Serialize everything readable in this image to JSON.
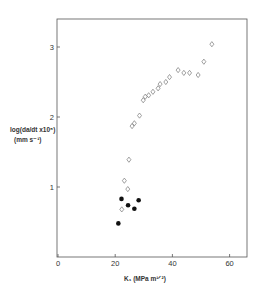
{
  "chart_data": {
    "type": "scatter",
    "title": "",
    "xlabel": "K_I (MPa m^1/2)",
    "ylabel": "log(da/dt x 10^5) (mm s^-1)",
    "xlim": [
      0,
      65
    ],
    "ylim": [
      0,
      3.4
    ],
    "x_ticks": [
      0,
      20,
      40,
      60
    ],
    "y_ticks": [
      1,
      2,
      3
    ],
    "grid": false,
    "legend": null,
    "series": [
      {
        "name": "open-diamonds",
        "marker": "open-diamond",
        "points": [
          [
            22.3,
            0.68
          ],
          [
            23.2,
            1.09
          ],
          [
            24.4,
            0.97
          ],
          [
            24.8,
            1.39
          ],
          [
            25.9,
            1.87
          ],
          [
            26.7,
            1.91
          ],
          [
            28.5,
            2.02
          ],
          [
            29.8,
            2.24
          ],
          [
            30.5,
            2.29
          ],
          [
            31.7,
            2.31
          ],
          [
            33.2,
            2.36
          ],
          [
            35.0,
            2.41
          ],
          [
            35.7,
            2.47
          ],
          [
            37.7,
            2.5
          ],
          [
            39.0,
            2.57
          ],
          [
            42.0,
            2.67
          ],
          [
            44.0,
            2.63
          ],
          [
            46.0,
            2.63
          ],
          [
            49.0,
            2.6
          ],
          [
            51.0,
            2.79
          ],
          [
            53.8,
            3.04
          ]
        ]
      },
      {
        "name": "filled-circles",
        "marker": "filled-circle",
        "points": [
          [
            21.1,
            0.48
          ],
          [
            22.2,
            0.83
          ],
          [
            24.5,
            0.74
          ],
          [
            26.7,
            0.69
          ],
          [
            28.2,
            0.81
          ]
        ]
      }
    ]
  },
  "labels": {
    "x_ticks": [
      "0",
      "20",
      "40",
      "60"
    ],
    "y_ticks": [
      "1",
      "2",
      "3"
    ],
    "y_label_line1": "log(da/dt x10⁵)",
    "y_label_line2": "(mm s⁻¹)",
    "x_label": "K₁ (MPa m¹ᐟ²)"
  }
}
